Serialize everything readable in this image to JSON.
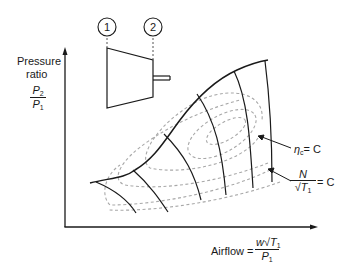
{
  "diagram": {
    "type": "compressor-map",
    "station_labels": [
      "1",
      "2"
    ],
    "y_axis": {
      "label_line1": "Pressure",
      "label_line2": "ratio",
      "fraction_num": "P",
      "fraction_num_sub": "2",
      "fraction_den": "P",
      "fraction_den_sub": "1"
    },
    "x_axis": {
      "label": "Airflow =",
      "fraction_num_w": "w",
      "fraction_num_T": "T",
      "fraction_num_T_sub": "1",
      "fraction_den": "P",
      "fraction_den_sub": "1"
    },
    "annotations": {
      "efficiency": {
        "symbol": "η",
        "sub": "c",
        "rhs": "= C"
      },
      "speed": {
        "num": "N",
        "den_T": "T",
        "den_sub": "1",
        "rhs": "= C"
      }
    },
    "colors": {
      "line": "#1a1a1a",
      "dashed": "#a8a8a8"
    }
  }
}
